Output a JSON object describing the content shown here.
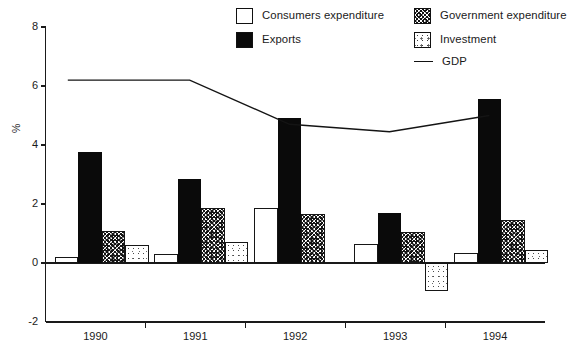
{
  "chart_data": {
    "type": "bar",
    "title": "",
    "xlabel": "",
    "ylabel": "%",
    "categories": [
      "1990",
      "1991",
      "1992",
      "1993",
      "1994"
    ],
    "ylim": [
      -2,
      8
    ],
    "yticks": [
      -2,
      0,
      2,
      4,
      6,
      8
    ],
    "grid": false,
    "legend_position": "top-right",
    "series": [
      {
        "name": "Consumers expenditure",
        "type": "bar",
        "fill": "white",
        "values": [
          0.2,
          0.3,
          1.85,
          0.65,
          0.35
        ]
      },
      {
        "name": "Exports",
        "type": "bar",
        "fill": "solid-black",
        "values": [
          3.75,
          2.85,
          4.9,
          1.7,
          5.55
        ]
      },
      {
        "name": "Government expenditure",
        "type": "bar",
        "fill": "dense-dots",
        "values": [
          1.1,
          1.85,
          1.65,
          1.05,
          1.45
        ]
      },
      {
        "name": "Investment",
        "type": "bar",
        "fill": "light-dots",
        "values": [
          0.6,
          0.7,
          0.0,
          -0.95,
          0.45
        ]
      },
      {
        "name": "GDP",
        "type": "line",
        "fill": "line",
        "values": [
          6.2,
          6.2,
          4.7,
          4.45,
          5.0
        ]
      }
    ]
  },
  "legend": {
    "items": [
      {
        "label": "Consumers expenditure",
        "swatch": "square-white"
      },
      {
        "label": "Government expenditure",
        "swatch": "square-dense-dots"
      },
      {
        "label": "Exports",
        "swatch": "square-solid-black"
      },
      {
        "label": "Investment",
        "swatch": "square-light-dots"
      },
      {
        "label": "GDP",
        "swatch": "line-black"
      }
    ]
  },
  "axes": {
    "y_label": "%",
    "y_ticks": [
      "8",
      "6",
      "4",
      "2",
      "0",
      "-2"
    ],
    "x_ticks": [
      "1990",
      "1991",
      "1992",
      "1993",
      "1994"
    ]
  },
  "colors": {
    "ink": "#1a1a1a",
    "solid_bar": "#0a0a0a",
    "background": "#ffffff"
  }
}
